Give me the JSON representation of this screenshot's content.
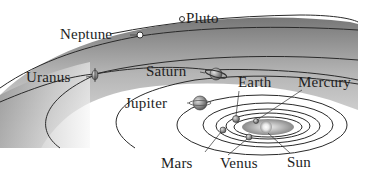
{
  "labels": {
    "pluto": "Pluto",
    "neptune": "Neptune",
    "uranus": "Uranus",
    "saturn": "Saturn",
    "earth": "Earth",
    "mercury": "Mercury",
    "jupiter": "Jupiter",
    "mars": "Mars",
    "venus": "Venus",
    "sun": "Sun"
  },
  "colors": {
    "band_dark": "#8a8a8a",
    "band_light": "#ececec",
    "orbit_line": "#2a2a2a",
    "label_text": "#1e1e1e"
  }
}
